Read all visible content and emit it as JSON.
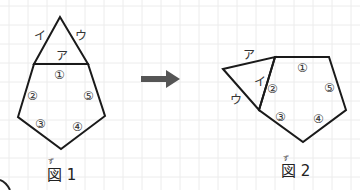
{
  "figure1": {
    "caption": "図 1",
    "ruby": "ず",
    "edge_labels": {
      "a": "ア",
      "i": "イ",
      "u": "ウ"
    },
    "region_labels": [
      "①",
      "②",
      "③",
      "④",
      "⑤"
    ]
  },
  "figure2": {
    "caption": "図 2",
    "ruby": "ず",
    "edge_labels": {
      "a": "ア",
      "i": "イ",
      "u": "ウ"
    },
    "region_labels": [
      "①",
      "②",
      "③",
      "④",
      "⑤"
    ]
  },
  "arrow": {
    "direction": "right",
    "color": "#555555"
  }
}
